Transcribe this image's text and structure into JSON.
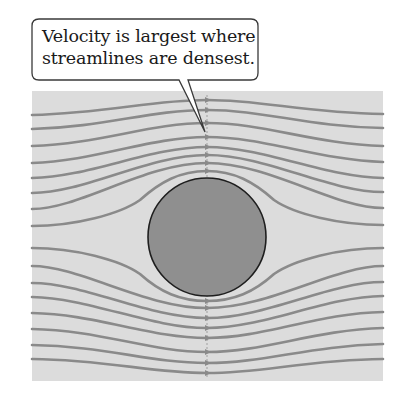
{
  "callout": {
    "line1": "Velocity is largest where",
    "line2": "streamlines are densest."
  },
  "colors": {
    "background": "#ffffff",
    "field": "#dcdcdc",
    "streamline": "#8a8a8a",
    "obstacle_fill": "#8f8f8f",
    "obstacle_stroke": "#1e1e1e",
    "callout_border": "#3a3a3a"
  },
  "diagram": {
    "field_box": {
      "x": 32,
      "y": 91,
      "width": 351,
      "height": 290
    },
    "obstacle": {
      "cx": 207,
      "cy": 237,
      "r": 59
    },
    "streamlines_count": 16,
    "cross_section_x": 207
  }
}
